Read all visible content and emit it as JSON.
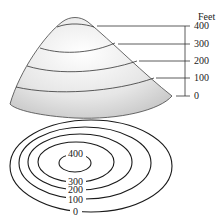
{
  "diagram": {
    "scale_unit": "Feet",
    "scale_ticks": [
      "400",
      "300",
      "200",
      "100",
      "0"
    ],
    "contour_labels": [
      "400",
      "300",
      "200",
      "100",
      "0"
    ],
    "colors": {
      "line": "#222222",
      "hill_light": "#ffffff",
      "hill_shade": "#cfcfcf"
    }
  }
}
